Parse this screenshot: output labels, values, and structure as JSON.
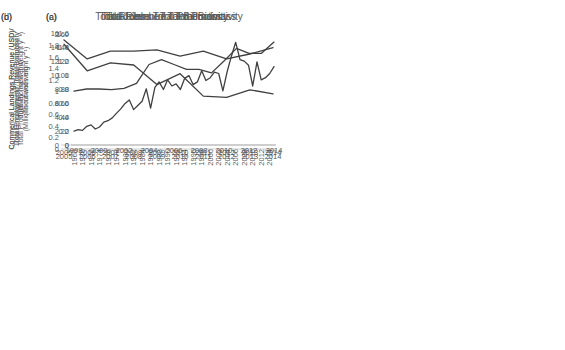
{
  "figure": {
    "background": "#ffffff",
    "line_color": "#404040",
    "axis_color": "#c0c0c0",
    "text_color": "#595959"
  },
  "chart_data": [
    {
      "panel": "(a)",
      "type": "line",
      "title": "Total Jobs / Total Biomass",
      "ylabel_line1": "Total Employment / Total Biomass",
      "ylabel_line2": "(Thousands mt)",
      "x": [
        2005,
        2006,
        2007,
        2008,
        2009,
        2010,
        2011,
        2012,
        2013,
        2014
      ],
      "values": [
        1.82,
        1.36,
        1.5,
        1.46,
        1.12,
        1.31,
        0.92,
        0.9,
        1.03,
        0.96
      ],
      "xticks": [
        2005,
        2006,
        2007,
        2008,
        2009,
        2010,
        2011,
        2012,
        2013,
        2014
      ],
      "yticks": [
        0,
        0.2,
        0.4,
        0.6,
        0.8,
        1,
        1.2,
        1.4,
        1.6,
        1.8,
        2
      ],
      "ylim": [
        0,
        2
      ],
      "grid": false,
      "legend": null
    },
    {
      "panel": "(b)",
      "type": "line",
      "title": "Total Revenue / Total Biomass",
      "ylabel_line1": "Commerical Landings Revenue (USD)/",
      "ylabel_line2": "Total Biomass (mt)",
      "x": [
        1968,
        1969,
        1970,
        1971,
        1972,
        1973,
        1974,
        1975,
        1976,
        1977,
        1978,
        1979,
        1980,
        1981,
        1982,
        1983,
        1984,
        1985,
        1986,
        1987,
        1988,
        1989,
        1990,
        1991,
        1992,
        1993,
        1994,
        1995,
        1996,
        1997,
        1998,
        1999,
        2000,
        2001,
        2002,
        2003,
        2004,
        2005,
        2006,
        2007,
        2008,
        2009,
        2010,
        2011,
        2012,
        2013,
        2014,
        2015
      ],
      "values": [
        20,
        22,
        21,
        27,
        29,
        23,
        26,
        33,
        35,
        39,
        46,
        52,
        60,
        65,
        51,
        57,
        63,
        81,
        53,
        83,
        91,
        80,
        94,
        85,
        88,
        80,
        96,
        100,
        87,
        91,
        107,
        93,
        97,
        105,
        103,
        78,
        106,
        128,
        148,
        123,
        121,
        115,
        85,
        120,
        94,
        97,
        103,
        113
      ],
      "xticks": [
        1968,
        1970,
        1972,
        1974,
        1976,
        1978,
        1980,
        1982,
        1984,
        1986,
        1988,
        1990,
        1992,
        1994,
        1996,
        1998,
        2000,
        2002,
        2004,
        2006,
        2008,
        2010,
        2012,
        2014
      ],
      "yticks": [
        0,
        20,
        40,
        60,
        80,
        100,
        120,
        140,
        160
      ],
      "ylim": [
        0,
        160
      ],
      "grid": false,
      "legend": null
    },
    {
      "panel": "(c)",
      "type": "line",
      "title": "Total Jobs / Total Productivity",
      "ylabel_line1": "Total Employment / Total Productivity",
      "ylabel_line2": "(Millions mt wet weight y⁻¹)",
      "x": [
        2005,
        2006,
        2007,
        2008,
        2009,
        2010,
        2011,
        2012,
        2013,
        2014
      ],
      "values": [
        15,
        12.3,
        13.4,
        13.4,
        13.6,
        12.7,
        13.4,
        12.3,
        13,
        13.9
      ],
      "xticks": [
        2005,
        2006,
        2007,
        2008,
        2009,
        2010,
        2011,
        2012,
        2013,
        2014
      ],
      "yticks": [
        0,
        2,
        4,
        6,
        8,
        10,
        12,
        14,
        16
      ],
      "ylim": [
        0,
        16
      ],
      "grid": false,
      "legend": null
    },
    {
      "panel": "(d)",
      "type": "line",
      "title": "Total Revenue / Total Productivity",
      "ylabel_line1": "Commerical Landings Revenue (USD)/",
      "ylabel_line2": "Total Productivity (mt wet weight y⁻¹)",
      "x": [
        1998,
        1999,
        2000,
        2001,
        2002,
        2003,
        2004,
        2005,
        2006,
        2007,
        2008,
        2009,
        2010,
        2011,
        2012,
        2013,
        2014
      ],
      "values": [
        0.77,
        0.8,
        0.8,
        0.79,
        0.81,
        0.88,
        1.15,
        1.22,
        1.15,
        1.08,
        1.08,
        1.03,
        1.2,
        1.38,
        1.31,
        1.31,
        1.47
      ],
      "xticks": [
        1998,
        2000,
        2002,
        2004,
        2006,
        2008,
        2010,
        2012,
        2014
      ],
      "yticks": [
        0,
        0.2,
        0.4,
        0.6,
        0.8,
        1,
        1.2,
        1.4,
        1.6
      ],
      "ylim": [
        0,
        1.6
      ],
      "grid": false,
      "legend": null
    }
  ]
}
